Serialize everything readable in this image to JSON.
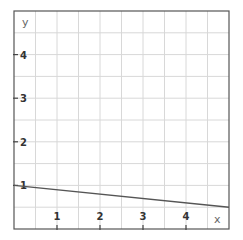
{
  "chart_data": {
    "type": "line",
    "title": "",
    "xlabel": "x",
    "ylabel": "y",
    "xlim": [
      0,
      5
    ],
    "ylim": [
      0,
      5
    ],
    "grid": true,
    "grid_step": 0.5,
    "x_ticks": [
      1,
      2,
      3,
      4
    ],
    "y_ticks": [
      1,
      2,
      3,
      4
    ],
    "series": [
      {
        "name": "y = 1 - 0.1x",
        "x": [
          0,
          5
        ],
        "values": [
          1.0,
          0.5
        ],
        "color": "#555555"
      }
    ]
  },
  "colors": {
    "grid": "#d8d8d8",
    "frame": "#555555",
    "line": "#555555"
  }
}
